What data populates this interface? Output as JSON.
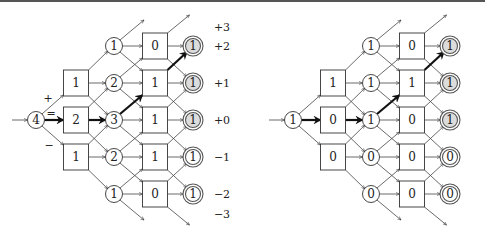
{
  "row_labels": [
    "+3",
    "+2",
    "+1",
    "+0",
    "−1",
    "−2",
    "−3"
  ],
  "transition_labels": {
    "plus": "+",
    "equal": "=",
    "minus": "−"
  },
  "diagrams": [
    {
      "name": "left",
      "start": "4",
      "col1": [
        "1",
        "2",
        "1"
      ],
      "col2": [
        "1",
        "2",
        "3",
        "2",
        "1"
      ],
      "col3": [
        "0",
        "1",
        "1",
        "1",
        "0"
      ],
      "final": [
        "1",
        "1",
        "1",
        "1",
        "1"
      ],
      "final_accepted": [
        true,
        true,
        true,
        false,
        false
      ]
    },
    {
      "name": "right",
      "start": "1",
      "col1": [
        "1",
        "0",
        "0"
      ],
      "col2": [
        "1",
        "1",
        "1",
        "0",
        "0"
      ],
      "col3": [
        "0",
        "1",
        "0",
        "0",
        "0"
      ],
      "final": [
        "1",
        "1",
        "1",
        "0",
        "0"
      ],
      "final_accepted": [
        true,
        true,
        true,
        false,
        false
      ]
    }
  ],
  "highlighted_path": [
    "start",
    "col1:row0",
    "col2:row0",
    "col3:row+1",
    "final:row+2"
  ],
  "colors": {
    "accepted_fill": "#dcdcdc",
    "stroke": "#333333",
    "path": "#111111"
  }
}
